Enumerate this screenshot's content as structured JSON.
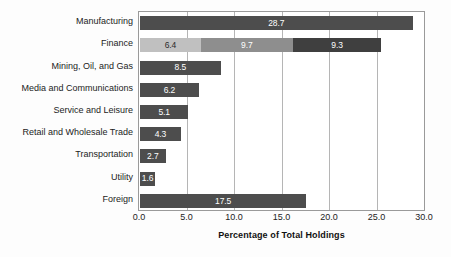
{
  "chart_data": {
    "type": "bar",
    "orientation": "horizontal",
    "stacked": true,
    "title": "",
    "xlabel": "Percentage of Total Holdings",
    "ylabel": "",
    "xlim": [
      0.0,
      30.0
    ],
    "xticks": [
      "0.0",
      "5.0",
      "10.0",
      "15.0",
      "20.0",
      "25.0",
      "30.0"
    ],
    "xtick_values": [
      0,
      5,
      10,
      15,
      20,
      25,
      30
    ],
    "grid": true,
    "grid_axis": "x",
    "legend": "none",
    "categories": [
      "Manufacturing",
      "Finance",
      "Mining, Oil, and Gas",
      "Media and Communications",
      "Service and Leisure",
      "Retail and Wholesale Trade",
      "Transportation",
      "Utility",
      "Foreign"
    ],
    "bars": [
      {
        "category": "Manufacturing",
        "total": 28.7,
        "segments": [
          {
            "value": 28.7,
            "label": "28.7",
            "color": "#4d4d4d",
            "label_color": "light"
          }
        ]
      },
      {
        "category": "Finance",
        "total": 25.4,
        "segments": [
          {
            "value": 6.4,
            "label": "6.4",
            "color": "#c0c0c0",
            "label_color": "dark"
          },
          {
            "value": 9.7,
            "label": "9.7",
            "color": "#8e8e8e",
            "label_color": "light"
          },
          {
            "value": 9.3,
            "label": "9.3",
            "color": "#3f3f3f",
            "label_color": "light"
          }
        ]
      },
      {
        "category": "Mining, Oil, and Gas",
        "total": 8.5,
        "segments": [
          {
            "value": 8.5,
            "label": "8.5",
            "color": "#4d4d4d",
            "label_color": "light"
          }
        ]
      },
      {
        "category": "Media and Communications",
        "total": 6.2,
        "segments": [
          {
            "value": 6.2,
            "label": "6.2",
            "color": "#4d4d4d",
            "label_color": "light"
          }
        ]
      },
      {
        "category": "Service and Leisure",
        "total": 5.1,
        "segments": [
          {
            "value": 5.1,
            "label": "5.1",
            "color": "#4d4d4d",
            "label_color": "light"
          }
        ]
      },
      {
        "category": "Retail and Wholesale Trade",
        "total": 4.3,
        "segments": [
          {
            "value": 4.3,
            "label": "4.3",
            "color": "#4d4d4d",
            "label_color": "light"
          }
        ]
      },
      {
        "category": "Transportation",
        "total": 2.7,
        "segments": [
          {
            "value": 2.7,
            "label": "2.7",
            "color": "#4d4d4d",
            "label_color": "light"
          }
        ]
      },
      {
        "category": "Utility",
        "total": 1.6,
        "segments": [
          {
            "value": 1.6,
            "label": "1.6",
            "color": "#4d4d4d",
            "label_color": "light"
          }
        ]
      },
      {
        "category": "Foreign",
        "total": 17.5,
        "segments": [
          {
            "value": 17.5,
            "label": "17.5",
            "color": "#4d4d4d",
            "label_color": "light"
          }
        ]
      }
    ],
    "colors": {
      "bar_default": "#4d4d4d",
      "finance_light": "#c0c0c0",
      "finance_medium": "#8e8e8e",
      "finance_dark": "#3f3f3f",
      "gridline": "#b5b5b5",
      "frame": "#9a9a9a",
      "background": "#fdfdfd",
      "text": "#1c1c1c"
    }
  }
}
